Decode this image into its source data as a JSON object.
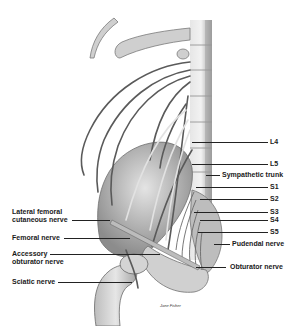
{
  "figure": {
    "type": "anatomical illustration",
    "signature": "Jane Fisher"
  },
  "labels_left": [
    {
      "id": "lateral-femoral-cutaneous",
      "text": "Lateral femoral cutaneous nerve",
      "line1": "Lateral femoral",
      "line2": "cutaneous nerve"
    },
    {
      "id": "femoral",
      "text": "Femoral nerve"
    },
    {
      "id": "accessory-obturator",
      "text": "Accessory obturator nerve",
      "line1": "Accessory",
      "line2": "obturator nerve"
    },
    {
      "id": "sciatic",
      "text": "Sciatic nerve"
    }
  ],
  "labels_right": [
    {
      "id": "l4",
      "text": "L4"
    },
    {
      "id": "l5",
      "text": "L5"
    },
    {
      "id": "sympathetic-trunk",
      "text": "Sympathetic trunk"
    },
    {
      "id": "s1",
      "text": "S1"
    },
    {
      "id": "s2",
      "text": "S2"
    },
    {
      "id": "s3",
      "text": "S3"
    },
    {
      "id": "s4",
      "text": "S4"
    },
    {
      "id": "s5",
      "text": "S5"
    },
    {
      "id": "pudendal",
      "text": "Pudendal nerve"
    },
    {
      "id": "obturator",
      "text": "Obturator nerve"
    }
  ],
  "colors": {
    "bone": "#c8c8c8",
    "bone_shadow": "#8a8a8a",
    "nerve": "#5a5a5a",
    "nerve_light": "#d8d8d8",
    "leader": "#222222"
  }
}
